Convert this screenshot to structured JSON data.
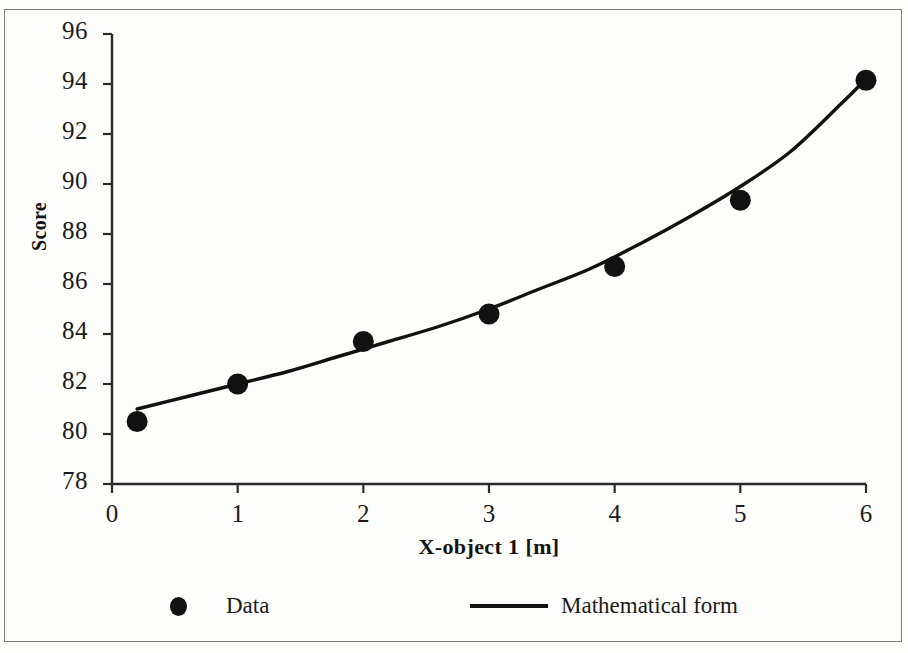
{
  "chart_data": {
    "type": "scatter",
    "title": "",
    "xlabel": "X-object 1 [m]",
    "ylabel": "Score",
    "xlim": [
      0,
      6
    ],
    "ylim": [
      78,
      96
    ],
    "xticks": [
      "0",
      "1",
      "2",
      "3",
      "4",
      "5",
      "6"
    ],
    "yticks": [
      "78",
      "80",
      "82",
      "84",
      "86",
      "88",
      "90",
      "92",
      "94",
      "96"
    ],
    "grid": false,
    "legend_position": "below-axes",
    "series": [
      {
        "name": "Data",
        "type": "scatter",
        "marker": "filled-circle",
        "color": "#111111",
        "x": [
          0.2,
          1,
          2,
          3,
          4,
          5,
          6
        ],
        "y": [
          80.5,
          82.0,
          83.7,
          84.8,
          86.7,
          89.35,
          94.15
        ]
      },
      {
        "name": "Mathematical form",
        "type": "line",
        "color": "#111111",
        "x": [
          0.2,
          0.6,
          1.0,
          1.4,
          1.8,
          2.2,
          2.6,
          3.0,
          3.4,
          3.8,
          4.2,
          4.6,
          5.0,
          5.4,
          5.8,
          6.0
        ],
        "y": [
          81.0,
          81.5,
          82.0,
          82.5,
          83.1,
          83.7,
          84.3,
          85.0,
          85.8,
          86.6,
          87.6,
          88.7,
          89.9,
          91.3,
          93.2,
          94.2
        ]
      }
    ]
  },
  "axes": {
    "y_title": "Score",
    "x_title": "X-object 1 [m]",
    "y_tick_labels": [
      "96",
      "94",
      "92",
      "90",
      "88",
      "86",
      "84",
      "82",
      "80",
      "78"
    ],
    "x_tick_labels": [
      "0",
      "1",
      "2",
      "3",
      "4",
      "5",
      "6"
    ]
  },
  "legend": {
    "entries": [
      {
        "label": "Data",
        "marker": "dot"
      },
      {
        "label": "Mathematical form",
        "marker": "line"
      }
    ]
  },
  "colors": {
    "ink": "#111111",
    "axis": "#2b2b2b",
    "frame": "#7d7d7d",
    "background": "#fdfdfc"
  }
}
